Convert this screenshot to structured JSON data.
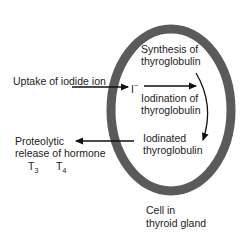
{
  "diagram": {
    "cell_label_line1": "Cell in",
    "cell_label_line2": "thyroid gland",
    "uptake_label": "Uptake of iodide ion",
    "iodide_symbol": "I",
    "iodide_charge": "−",
    "synthesis_line1": "Synthesis of",
    "synthesis_line2": "thyroglobulin",
    "iodination_line1": "Iodination of",
    "iodination_line2": "thyroglobulin",
    "iodinated_line1": "Iodinated",
    "iodinated_line2": "thyroglobulin",
    "release_line1": "Proteolytic",
    "release_line2": "release of hormone",
    "t3_base": "T",
    "t3_sub": "3",
    "t4_base": "T",
    "t4_sub": "4",
    "colors": {
      "cell_membrane": "#5a5a5a",
      "text": "#222222",
      "arrow": "#111111"
    }
  }
}
